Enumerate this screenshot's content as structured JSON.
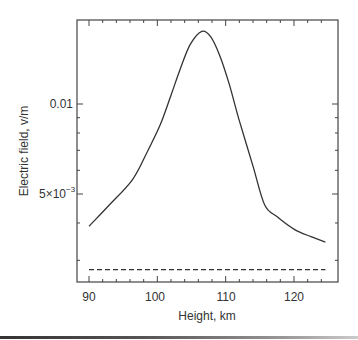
{
  "chart_data": {
    "type": "line",
    "title": "",
    "xlabel": "Height, km",
    "ylabel": "Electric field, v/m",
    "xlim": [
      88,
      125.5
    ],
    "ylim_log": [
      0.00255,
      0.0198
    ],
    "yscale": "log",
    "grid": false,
    "legend": null,
    "x_ticks": [
      90,
      100,
      110,
      120
    ],
    "x_tick_labels": [
      "90",
      "100",
      "110",
      "120"
    ],
    "y_ticks": [
      0.005,
      0.01
    ],
    "y_tick_labels": [
      "5×10⁻³",
      "0.01"
    ],
    "series": [
      {
        "name": "solid",
        "style": "solid",
        "x": [
          90,
          93,
          96.4,
          98.5,
          100.4,
          102,
          103.3,
          104.8,
          106.5,
          107.8,
          109.1,
          110.5,
          112,
          114,
          115.7,
          117.5,
          120.1,
          122.5,
          124.6
        ],
        "y": [
          0.0039,
          0.0046,
          0.0056,
          0.0069,
          0.0085,
          0.0107,
          0.013,
          0.0158,
          0.0175,
          0.0168,
          0.0146,
          0.0117,
          0.0088,
          0.0062,
          0.0046,
          0.0042,
          0.0038,
          0.0036,
          0.00345
        ]
      },
      {
        "name": "dashed",
        "style": "dashed",
        "x": [
          90,
          124.6
        ],
        "y": [
          0.00279,
          0.00279
        ]
      }
    ]
  },
  "labels": {
    "xlabel": "Height, km",
    "ylabel": "Electric field, v/m",
    "ytick_001": "0.01",
    "ytick_5e3_mant": "5×10",
    "ytick_5e3_exp": "−3",
    "xtick_90": "90",
    "xtick_100": "100",
    "xtick_110": "110",
    "xtick_120": "120"
  }
}
